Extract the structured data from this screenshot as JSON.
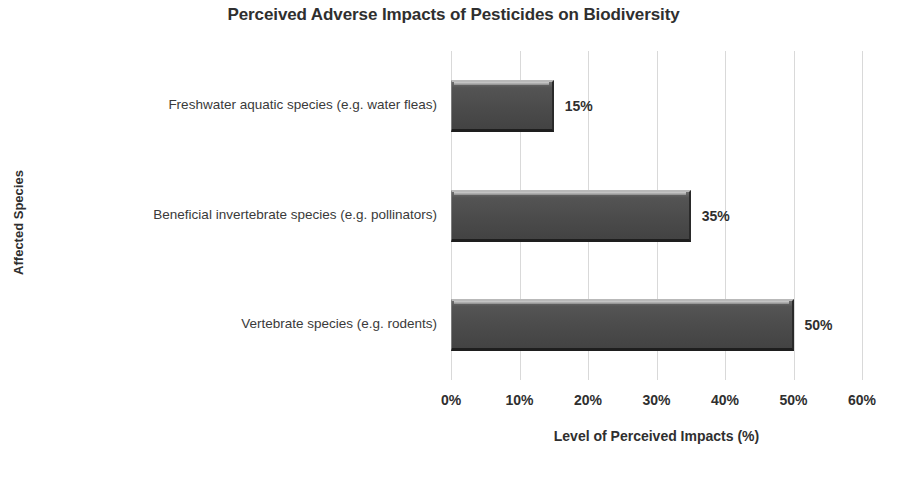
{
  "chart_data": {
    "type": "bar",
    "orientation": "horizontal",
    "title": "Perceived Adverse Impacts of Pesticides on Biodiversity",
    "xlabel": "Level of Perceived Impacts (%)",
    "ylabel": "Affected Species",
    "xlim": [
      0,
      60
    ],
    "xtick_values": [
      0,
      10,
      20,
      30,
      40,
      50,
      60
    ],
    "xtick_labels": [
      "0%",
      "10%",
      "20%",
      "30%",
      "40%",
      "50%",
      "60%"
    ],
    "grid": "vertical",
    "legend": "none",
    "bar_color": "#4b4b4b",
    "bar_edge_highlight": "#b9b9b9",
    "bar_edge_shadow": "#1e1e1e",
    "gridline_color": "#d9d9d9",
    "text_color": "#2f2f2f",
    "categories": [
      "Freshwater aquatic species (e.g. water fleas)",
      "Beneficial invertebrate species (e.g. pollinators)",
      "Vertebrate species (e.g. rodents)"
    ],
    "values": [
      15,
      35,
      50
    ],
    "value_labels": [
      "15%",
      "35%",
      "50%"
    ],
    "bars": [
      {
        "category": "Freshwater aquatic species (e.g. water fleas)",
        "value": 15,
        "label": "15%"
      },
      {
        "category": "Beneficial invertebrate species (e.g. pollinators)",
        "value": 35,
        "label": "35%"
      },
      {
        "category": "Vertebrate species (e.g. rodents)",
        "value": 50,
        "label": "50%"
      }
    ]
  }
}
